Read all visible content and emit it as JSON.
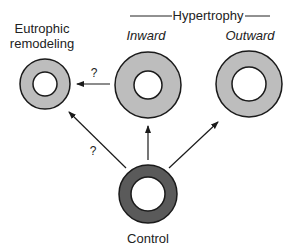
{
  "diagram": {
    "group_label": "Hypertrophy",
    "nodes": {
      "eutrophic": {
        "label_line1": "Eutrophic",
        "label_line2": "remodeling"
      },
      "inward": {
        "label": "Inward"
      },
      "outward": {
        "label": "Outward"
      },
      "control": {
        "label": "Control"
      }
    },
    "edges": [
      {
        "from": "inward",
        "to": "eutrophic",
        "label": "?"
      },
      {
        "from": "control",
        "to": "eutrophic",
        "label": "?"
      },
      {
        "from": "control",
        "to": "inward",
        "label": ""
      },
      {
        "from": "control",
        "to": "outward",
        "label": ""
      }
    ],
    "colors": {
      "wall_light": "#bdbdbd",
      "wall_dark": "#5a5a5a",
      "outline": "#1a1a1a"
    }
  }
}
